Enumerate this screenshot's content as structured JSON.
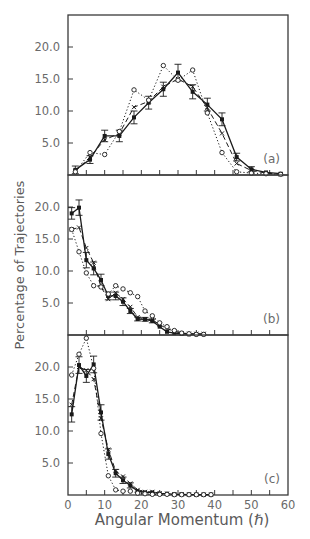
{
  "figure": {
    "ylabel": "Percentage of Trajectories",
    "xlabel": "Angular Momentum (ℏ)"
  },
  "colors": {
    "axis": "#3a3a3a",
    "ink": "#1a1a1a",
    "text": "#6a6a6a",
    "background": "#ffffff"
  },
  "chart_data": [
    {
      "type": "line",
      "panel_label": "(a)",
      "title": "",
      "xlabel": "Angular Momentum (ℏ)",
      "ylabel": "Percentage of Trajectories",
      "xlim": [
        0,
        60
      ],
      "ylim": [
        0,
        25
      ],
      "yticks": [
        "5.0",
        "10.0",
        "15.0",
        "20.0"
      ],
      "ytick_values": [
        5,
        10,
        15,
        20
      ],
      "xticks": [
        0,
        5,
        10,
        15,
        20,
        25,
        30,
        35,
        40,
        45,
        50,
        55,
        60
      ],
      "grid": false,
      "x": [
        2,
        6,
        10,
        14,
        18,
        22,
        26,
        30,
        34,
        38,
        42,
        46,
        50,
        54,
        58
      ],
      "series": [
        {
          "name": "filled-square-solid",
          "style": "solid",
          "marker": "filled-square",
          "error_bars": true,
          "values": [
            0.8,
            2.4,
            6.1,
            6.1,
            9.0,
            11.3,
            13.4,
            16.0,
            13.0,
            11.0,
            8.7,
            2.8,
            0.9,
            0.4,
            0.2
          ],
          "errors": [
            0.6,
            0.6,
            0.9,
            0.9,
            1.0,
            1.0,
            1.1,
            1.3,
            1.1,
            1.0,
            1.0,
            0.6,
            0.4,
            0.2,
            0.1
          ]
        },
        {
          "name": "cross-dashed",
          "style": "dashed",
          "marker": "cross",
          "values": [
            0.6,
            2.8,
            5.5,
            6.5,
            10.6,
            11.5,
            13.8,
            15.0,
            13.8,
            10.5,
            6.5,
            1.8,
            0.7,
            0.3,
            0.1
          ]
        },
        {
          "name": "open-circle-dotted",
          "style": "dotted",
          "marker": "open-circle",
          "values": [
            0.5,
            3.5,
            3.2,
            6.8,
            13.3,
            11.7,
            17.1,
            14.8,
            16.4,
            9.7,
            3.5,
            0.5,
            0.3,
            0.2,
            0.1
          ]
        }
      ]
    },
    {
      "type": "line",
      "panel_label": "(b)",
      "title": "",
      "xlabel": "Angular Momentum (ℏ)",
      "ylabel": "Percentage of Trajectories",
      "xlim": [
        0,
        60
      ],
      "ylim": [
        0,
        25
      ],
      "yticks": [
        "5.0",
        "10.0",
        "15.0",
        "20.0"
      ],
      "ytick_values": [
        5,
        10,
        15,
        20
      ],
      "xticks": [
        0,
        5,
        10,
        15,
        20,
        25,
        30,
        35,
        40,
        45,
        50,
        55,
        60
      ],
      "grid": false,
      "x": [
        1,
        3,
        5,
        7,
        9,
        11,
        13,
        15,
        17,
        19,
        21,
        23,
        25,
        27,
        29,
        31,
        33,
        35,
        37
      ],
      "series": [
        {
          "name": "filled-square-solid",
          "style": "solid",
          "marker": "filled-square",
          "error_bars": true,
          "values": [
            19.0,
            19.9,
            11.7,
            10.4,
            8.6,
            6.1,
            6.1,
            5.2,
            3.75,
            2.5,
            2.45,
            2.2,
            1.3,
            0.5,
            0.3,
            0.2,
            0.1,
            0.1,
            0.1
          ],
          "errors": [
            0.9,
            1.2,
            1.2,
            1.0,
            0.9,
            0.6,
            0.6,
            0.6,
            0.4,
            0.3,
            0.3,
            0.3,
            0.2,
            0.1,
            0.1,
            0.1,
            0.05,
            0.05,
            0.05
          ]
        },
        {
          "name": "cross-dashed",
          "style": "dashed",
          "marker": "cross",
          "values": [
            16.5,
            16.8,
            13.6,
            11.3,
            7.5,
            5.6,
            6.6,
            5.6,
            4.4,
            2.8,
            2.5,
            2.4,
            1.6,
            1.0,
            0.6,
            0.3,
            0.2,
            0.2,
            0.2
          ]
        },
        {
          "name": "open-circle-dotted",
          "style": "dotted",
          "marker": "open-circle",
          "values": [
            16.5,
            13.0,
            9.7,
            7.7,
            7.5,
            6.4,
            7.7,
            7.2,
            6.6,
            6.0,
            3.75,
            3.0,
            1.9,
            1.3,
            0.7,
            0.3,
            0.2,
            0.1,
            0.1
          ]
        }
      ]
    },
    {
      "type": "line",
      "panel_label": "(c)",
      "title": "",
      "xlabel": "Angular Momentum (ℏ)",
      "ylabel": "Percentage of Trajectories",
      "xlim": [
        0,
        60
      ],
      "ylim": [
        0,
        25
      ],
      "yticks": [
        "5.0",
        "10.0",
        "15.0",
        "20.0"
      ],
      "ytick_values": [
        5,
        10,
        15,
        20
      ],
      "xticks": [
        0,
        5,
        10,
        15,
        20,
        25,
        30,
        35,
        40,
        45,
        50,
        55,
        60
      ],
      "xtick_labels": [
        "0",
        "10",
        "20",
        "30",
        "40",
        "50",
        "60"
      ],
      "xtick_label_values": [
        0,
        10,
        20,
        30,
        40,
        50,
        60
      ],
      "grid": false,
      "x": [
        1,
        3,
        5,
        7,
        9,
        11,
        13,
        15,
        17,
        19,
        21,
        23,
        25,
        27,
        29,
        31,
        33,
        35,
        37,
        39
      ],
      "series": [
        {
          "name": "filled-square-solid",
          "style": "solid",
          "marker": "filled-square",
          "error_bars": true,
          "values": [
            12.6,
            20.3,
            18.6,
            20.4,
            12.9,
            6.4,
            3.4,
            2.3,
            1.5,
            0.6,
            0.4,
            0.4,
            0.2,
            0.2,
            0.1,
            0.1,
            0.05,
            0.05,
            0.05,
            0.05
          ],
          "errors": [
            1.2,
            1.3,
            1.0,
            1.3,
            1.2,
            0.8,
            0.6,
            0.5,
            0.4,
            0.2,
            0.2,
            0.2,
            0.1,
            0.1,
            0.05,
            0.05,
            0.05,
            0.05,
            0.05,
            0.05
          ]
        },
        {
          "name": "cross-dashed",
          "style": "dashed",
          "marker": "cross",
          "values": [
            14.1,
            20.0,
            19.5,
            18.1,
            12.0,
            7.1,
            3.75,
            2.9,
            1.8,
            0.8,
            0.5,
            0.5,
            0.3,
            0.2,
            0.1,
            0.1,
            0.1,
            0.05,
            0.05,
            0.05
          ]
        },
        {
          "name": "open-circle-dotted",
          "style": "dotted",
          "marker": "open-circle",
          "values": [
            18.75,
            22.0,
            24.5,
            19.8,
            9.6,
            3.0,
            0.8,
            0.6,
            0.6,
            0.3,
            0.2,
            0.1,
            0.1,
            0.1,
            0.05,
            0.05,
            0.05,
            0.05,
            0.05,
            0.05
          ]
        }
      ]
    }
  ],
  "layout": {
    "plot_left": 68,
    "plot_right": 288,
    "panels": [
      {
        "top": 15,
        "bottom": 175
      },
      {
        "top": 175,
        "bottom": 335
      },
      {
        "top": 335,
        "bottom": 495
      }
    ],
    "y_pixels_per_unit": 6.4
  }
}
